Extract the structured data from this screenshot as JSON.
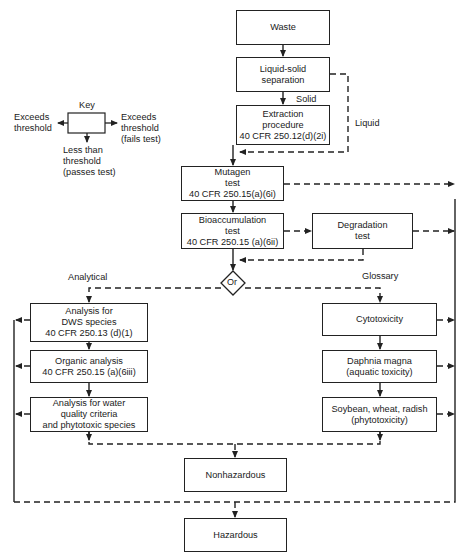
{
  "diagram": {
    "type": "flowchart",
    "nodes": {
      "waste": {
        "lines": [
          "Waste"
        ]
      },
      "liquid_solid": {
        "lines": [
          "Liquid-solid",
          "separation"
        ]
      },
      "extraction": {
        "lines": [
          "Extraction",
          "procedure",
          "40 CFR 250.12(d)(2i)"
        ]
      },
      "mutagen": {
        "lines": [
          "Mutagen",
          "test",
          "40 CFR 250.15(a)(6i)"
        ]
      },
      "bioaccumulation": {
        "lines": [
          "Bioaccumulation",
          "test",
          "40 CFR 250.15 (a)(6ii)"
        ]
      },
      "degradation": {
        "lines": [
          "Degradation",
          "test"
        ]
      },
      "or": {
        "label": "Or"
      },
      "dws": {
        "lines": [
          "Analysis for",
          "DWS species",
          "40 CFR 250.13 (d)(1)"
        ]
      },
      "organic": {
        "lines": [
          "Organic analysis",
          "40 CFR 250.15 (a)(6iii)"
        ]
      },
      "water_quality": {
        "lines": [
          "Analysis for water",
          "quality criteria",
          "and phytotoxic species"
        ]
      },
      "cytotoxicity": {
        "lines": [
          "Cytotoxicity"
        ]
      },
      "daphnia": {
        "lines": [
          "Daphnia magna",
          "(aquatic toxicity)"
        ]
      },
      "soybean": {
        "lines": [
          "Soybean, wheat, radish",
          "(phytotoxicity)"
        ]
      },
      "nonhazardous": {
        "lines": [
          "Nonhazardous"
        ]
      },
      "hazardous": {
        "lines": [
          "Hazardous"
        ]
      }
    },
    "edge_labels": {
      "solid": "Solid",
      "liquid": "Liquid",
      "analytical": "Analytical",
      "glossary": "Glossary"
    },
    "key": {
      "title": "Key",
      "left": [
        "Exceeds",
        "threshold"
      ],
      "right": [
        "Exceeds",
        "threshold",
        "(fails test)"
      ],
      "bottom": [
        "Less than",
        "threshold",
        "(passes test)"
      ]
    }
  }
}
